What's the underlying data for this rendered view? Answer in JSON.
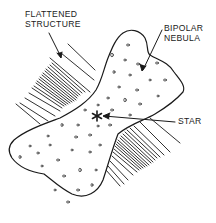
{
  "diagram": {
    "type": "labeled scientific illustration",
    "colors": {
      "ink": "#1a1a1a",
      "background": "#ffffff"
    },
    "labels": {
      "flattened_structure": {
        "line1": "FLATTENED",
        "line2": "STRUCTURE"
      },
      "bipolar_nebula": {
        "line1": "BIPOLAR",
        "line2": "NEBULA"
      },
      "star": "STAR"
    },
    "elements": [
      {
        "id": "bipolar-nebula",
        "shape": "hourglass lobed outline with stippled dots"
      },
      {
        "id": "flattened-structure",
        "shape": "hatched parallel line bands on both sides of the waist"
      },
      {
        "id": "star",
        "shape": "asterisk at nebula center"
      }
    ],
    "star_glyph": "✱"
  }
}
